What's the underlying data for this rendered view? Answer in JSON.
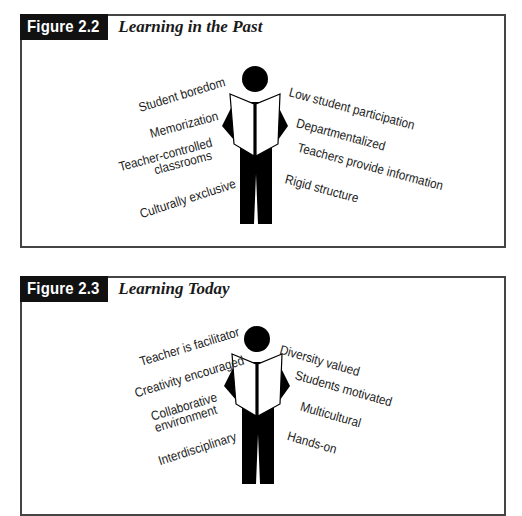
{
  "figures": [
    {
      "label": "Figure 2.2",
      "title": "Learning in the Past",
      "icon": "reading-person-icon",
      "left_phrases": [
        "Student boredom",
        "Memorization",
        "Teacher-controlled",
        "classrooms",
        "Culturally exclusive"
      ],
      "right_phrases": [
        "Low student participation",
        "Departmentalized",
        "Teachers provide information",
        "Rigid structure"
      ]
    },
    {
      "label": "Figure 2.3",
      "title": "Learning Today",
      "icon": "reading-person-icon",
      "left_phrases": [
        "Teacher is facilitator",
        "Creativity encouraged",
        "Collaborative",
        "environment",
        "Interdisciplinary"
      ],
      "right_phrases": [
        "Diversity valued",
        "Students motivated",
        "Multicultural",
        "Hands-on"
      ]
    }
  ]
}
